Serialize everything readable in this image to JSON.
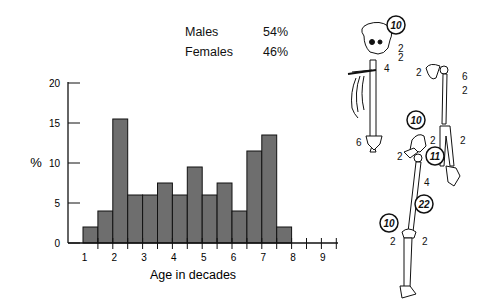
{
  "legend": {
    "rows": [
      {
        "label": "Males",
        "value": "54%"
      },
      {
        "label": "Females",
        "value": "46%"
      }
    ]
  },
  "chart_data": {
    "type": "bar",
    "title": "",
    "xlabel": "Age in decades",
    "ylabel": "%",
    "ylim": [
      0,
      20
    ],
    "yticks": [
      0,
      5,
      10,
      15,
      20
    ],
    "xtick_labels": [
      "1",
      "2",
      "3",
      "4",
      "5",
      "6",
      "7",
      "8",
      "9"
    ],
    "grid": false,
    "bin_width_decades": 0.5,
    "categories": [
      "0.5-1",
      "1-1.5",
      "1.5-2",
      "2-2.5",
      "2.5-3",
      "3-3.5",
      "3.5-4",
      "4-4.5",
      "4.5-5",
      "5-5.5",
      "5.5-6",
      "6-6.5",
      "6.5-7",
      "7-7.5"
    ],
    "values": [
      2,
      4,
      15.5,
      6,
      6,
      7.5,
      6,
      9.5,
      6,
      7.5,
      4,
      11.5,
      13.5,
      2
    ],
    "bar_color": "#6e6e6e",
    "sex_distribution": {
      "Males": 54,
      "Females": 46
    }
  },
  "skeleton": {
    "labels": [
      {
        "id": "skull",
        "value": "10",
        "circled": true
      },
      {
        "id": "mandible-1",
        "value": "2",
        "circled": false
      },
      {
        "id": "mandible-2",
        "value": "2",
        "circled": false
      },
      {
        "id": "cervical",
        "value": "4",
        "circled": false
      },
      {
        "id": "sacrum",
        "value": "6",
        "circled": false
      },
      {
        "id": "scapula",
        "value": "2",
        "circled": false
      },
      {
        "id": "proximal-humerus",
        "value": "6",
        "circled": false
      },
      {
        "id": "humerus-shaft",
        "value": "2",
        "circled": false
      },
      {
        "id": "radius",
        "value": "2",
        "circled": false
      },
      {
        "id": "ulna",
        "value": "2",
        "circled": false
      },
      {
        "id": "ilium",
        "value": "10",
        "circled": true
      },
      {
        "id": "pubis",
        "value": "2",
        "circled": false
      },
      {
        "id": "proximal-femur",
        "value": "11",
        "circled": true
      },
      {
        "id": "femur-shaft",
        "value": "4",
        "circled": false
      },
      {
        "id": "distal-femur",
        "value": "22",
        "circled": true
      },
      {
        "id": "proximal-tibia",
        "value": "10",
        "circled": true
      },
      {
        "id": "fibula",
        "value": "2",
        "circled": false
      },
      {
        "id": "tibia-shaft",
        "value": "2",
        "circled": false
      }
    ]
  }
}
